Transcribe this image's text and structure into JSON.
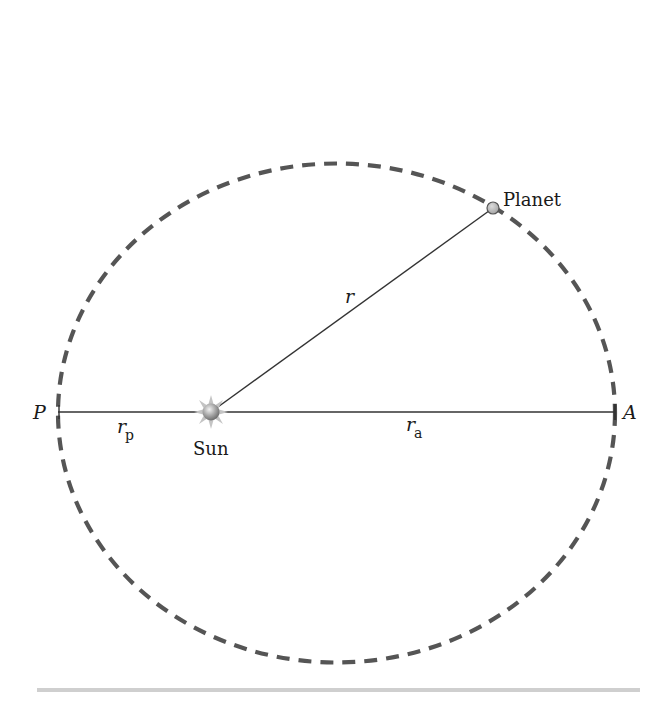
{
  "diagram": {
    "labels": {
      "perihelion": "P",
      "aphelion": "A",
      "planet": "Planet",
      "sun": "Sun",
      "radius": "r",
      "perihelion_distance_main": "r",
      "perihelion_distance_sub": "p",
      "aphelion_distance_main": "r",
      "aphelion_distance_sub": "a"
    },
    "colors": {
      "orbit": "#555555",
      "line": "#333333",
      "sun_body": "#9a9a9a",
      "sun_rays": "#bdbdbd",
      "planet_fill": "#b8b8b8",
      "planet_stroke": "#555555",
      "rule": "#cfcfcf"
    },
    "geometry": {
      "orbit_center": [
        336.5,
        413
      ],
      "orbit_radii": [
        278.5,
        249.5
      ],
      "sun_position": [
        211,
        412
      ],
      "planet_position": [
        493,
        208
      ]
    }
  }
}
